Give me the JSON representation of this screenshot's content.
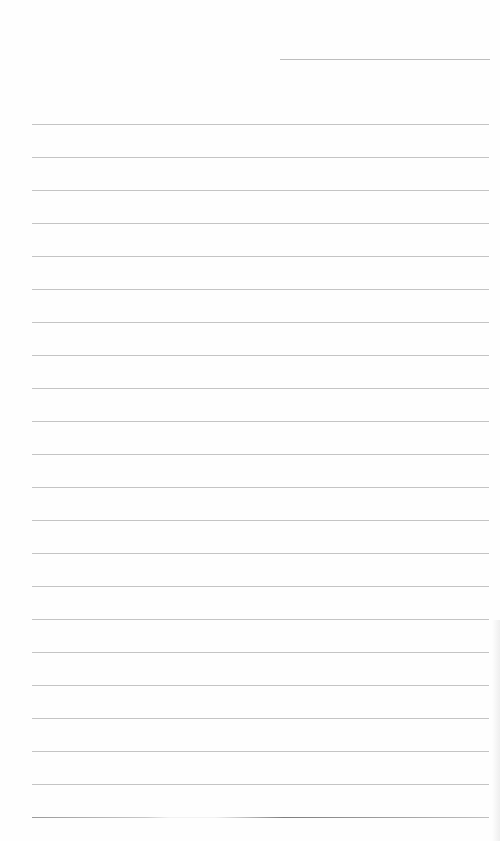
{
  "document": {
    "type": "lined-paper",
    "header_line": {
      "x": 280,
      "y": 59,
      "width": 210
    },
    "rules": {
      "count": 22,
      "start_y": 124,
      "spacing": 33,
      "left": 32,
      "right": 489,
      "color": "#c4c4c4"
    },
    "background": "#fefefe"
  }
}
